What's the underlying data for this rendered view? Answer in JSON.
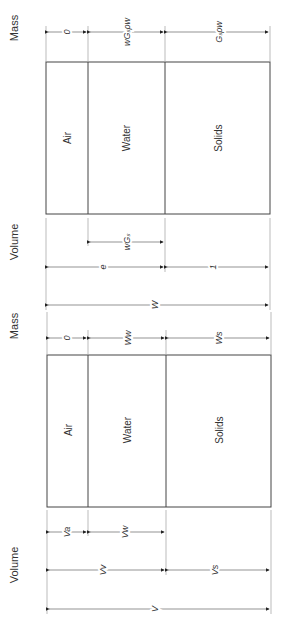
{
  "diagrams": [
    {
      "name": "normalized",
      "section_labels": {
        "mass": "Mass",
        "volume": "Volume"
      },
      "phases": [
        "Air",
        "Water",
        "Solids"
      ],
      "mass_dims": [
        "0",
        "wGₛρw",
        "Gₛρw"
      ],
      "volume_dims_inner": [
        "wGₛ"
      ],
      "volume_dims_outer": [
        "e",
        "1"
      ],
      "total": "W"
    },
    {
      "name": "general",
      "section_labels": {
        "mass": "Mass",
        "volume": "Volume"
      },
      "phases": [
        "Air",
        "Water",
        "Solids"
      ],
      "mass_dims": [
        "0",
        "Ww",
        "Ws"
      ],
      "volume_dims_inner": [
        "Va",
        "Vw"
      ],
      "volume_dims_outer": [
        "Vv",
        "Vs"
      ],
      "total": "V"
    }
  ]
}
